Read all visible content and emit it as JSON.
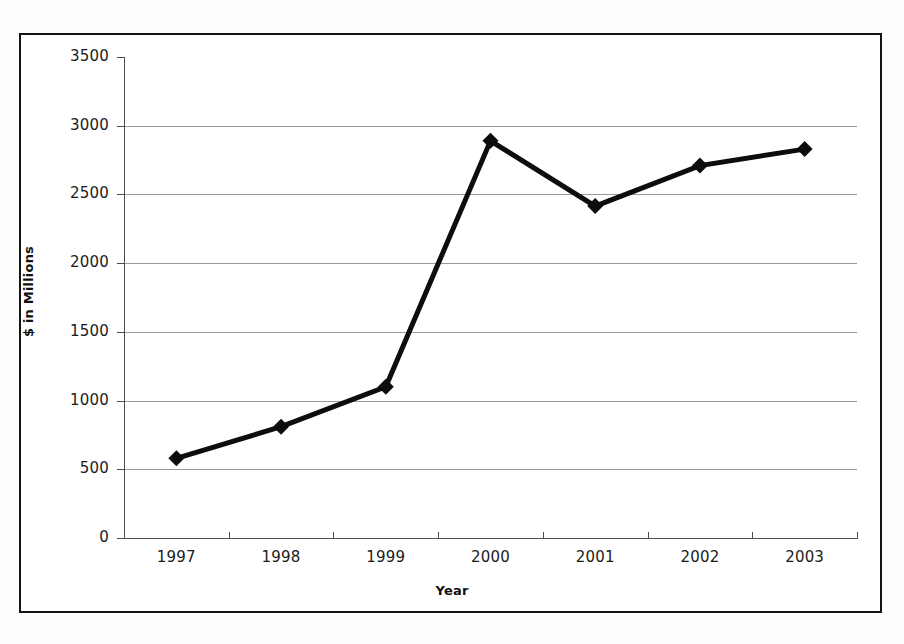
{
  "chart_data": {
    "type": "line",
    "title": "",
    "xlabel": "Year",
    "ylabel": "$ in Millions",
    "categories": [
      "1997",
      "1998",
      "1999",
      "2000",
      "2001",
      "2002",
      "2003"
    ],
    "values": [
      580,
      810,
      1100,
      2890,
      2415,
      2710,
      2830
    ],
    "series": [
      {
        "name": "$ in Millions",
        "values": [
          580,
          810,
          1100,
          2890,
          2415,
          2710,
          2830
        ]
      }
    ],
    "ylim": [
      0,
      3500
    ],
    "ytick_labels": [
      "0",
      "500",
      "1000",
      "1500",
      "2000",
      "2500",
      "3000",
      "3500"
    ],
    "ytick_values": [
      0,
      500,
      1000,
      1500,
      2000,
      2500,
      3000,
      3500
    ],
    "grid": "horizontal",
    "legend": "none",
    "marker": "diamond",
    "line_color": "#0d0d0d",
    "marker_color": "#0d0d0d",
    "gridline_color": "#9a9a9a",
    "axis_color": "#4d4d4d",
    "frame_color": "#141414",
    "background_color": "#ffffff"
  }
}
